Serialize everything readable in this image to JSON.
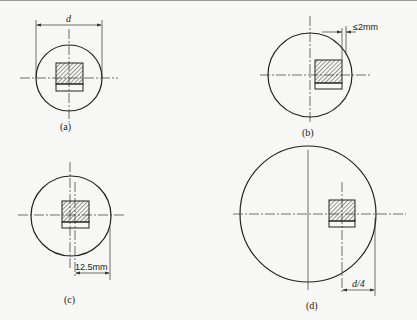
{
  "figure": {
    "panels": [
      {
        "id": "a",
        "caption": "(a)",
        "dimension_label": "d"
      },
      {
        "id": "b",
        "caption": "(b)",
        "dimension_label": "≤2mm"
      },
      {
        "id": "c",
        "caption": "(c)",
        "dimension_label": "12.5mm"
      },
      {
        "id": "d",
        "caption": "(d)",
        "dimension_label": "d/4"
      }
    ]
  }
}
